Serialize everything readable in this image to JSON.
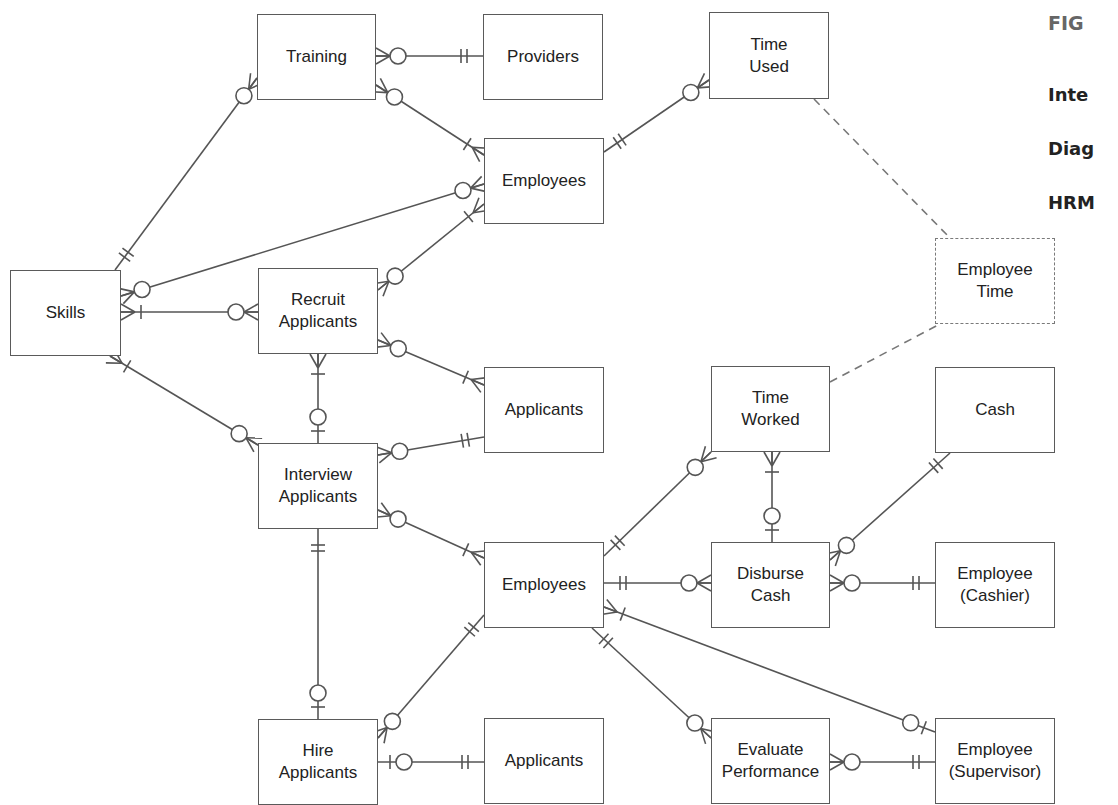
{
  "figure": {
    "label": "FIG",
    "caption_lines": [
      "Inte",
      "Diag",
      "HRM"
    ]
  },
  "style": {
    "line_color": "#555555",
    "border_color": "#5a5a5a",
    "caption_color": "#222222",
    "label_color": "#666666"
  },
  "entities": [
    {
      "id": "training",
      "label": "Training",
      "x": 257,
      "y": 14,
      "w": 119,
      "h": 86
    },
    {
      "id": "providers",
      "label": "Providers",
      "x": 483,
      "y": 14,
      "w": 120,
      "h": 86
    },
    {
      "id": "time_used",
      "label": "Time\nUsed",
      "x": 709,
      "y": 12,
      "w": 120,
      "h": 87
    },
    {
      "id": "employees_top",
      "label": "Employees",
      "x": 484,
      "y": 138,
      "w": 120,
      "h": 86
    },
    {
      "id": "skills",
      "label": "Skills",
      "x": 10,
      "y": 270,
      "w": 111,
      "h": 86
    },
    {
      "id": "recruit_applicants",
      "label": "Recruit\nApplicants",
      "x": 258,
      "y": 268,
      "w": 120,
      "h": 86
    },
    {
      "id": "employee_time",
      "label": "Employee\nTime",
      "x": 935,
      "y": 238,
      "w": 120,
      "h": 86,
      "dashed": true
    },
    {
      "id": "applicants_mid",
      "label": "Applicants",
      "x": 484,
      "y": 367,
      "w": 120,
      "h": 86
    },
    {
      "id": "time_worked",
      "label": "Time\nWorked",
      "x": 711,
      "y": 366,
      "w": 119,
      "h": 86
    },
    {
      "id": "cash",
      "label": "Cash",
      "x": 935,
      "y": 367,
      "w": 120,
      "h": 86
    },
    {
      "id": "interview_applicants",
      "label": "Interview\nApplicants",
      "x": 258,
      "y": 443,
      "w": 120,
      "h": 86
    },
    {
      "id": "employees_mid",
      "label": "Employees",
      "x": 484,
      "y": 542,
      "w": 120,
      "h": 86
    },
    {
      "id": "disburse_cash",
      "label": "Disburse\nCash",
      "x": 711,
      "y": 542,
      "w": 119,
      "h": 86
    },
    {
      "id": "employee_cashier",
      "label": "Employee\n(Cashier)",
      "x": 935,
      "y": 542,
      "w": 120,
      "h": 86
    },
    {
      "id": "hire_applicants",
      "label": "Hire\nApplicants",
      "x": 258,
      "y": 719,
      "w": 120,
      "h": 86
    },
    {
      "id": "applicants_bottom",
      "label": "Applicants",
      "x": 484,
      "y": 718,
      "w": 120,
      "h": 86
    },
    {
      "id": "evaluate_performance",
      "label": "Evaluate\nPerformance",
      "x": 711,
      "y": 718,
      "w": 119,
      "h": 86
    },
    {
      "id": "employee_supervisor",
      "label": "Employee\n(Supervisor)",
      "x": 935,
      "y": 718,
      "w": 120,
      "h": 86
    }
  ],
  "relationships": [
    {
      "from": "training",
      "to": "providers",
      "a": [
        376,
        56
      ],
      "b": [
        483,
        56
      ],
      "end_a": "zero-many",
      "end_b": "one-one"
    },
    {
      "from": "training",
      "to": "employees_top",
      "a": [
        376,
        85
      ],
      "b": [
        484,
        155
      ],
      "end_a": "zero-many",
      "end_b": "one-many"
    },
    {
      "from": "skills",
      "to": "training",
      "a": [
        115,
        270
      ],
      "b": [
        257,
        78
      ],
      "end_a": "one-one",
      "end_b": "zero-many"
    },
    {
      "from": "employees_top",
      "to": "time_used",
      "a": [
        604,
        152
      ],
      "b": [
        709,
        80
      ],
      "end_a": "one-one",
      "end_b": "zero-many"
    },
    {
      "from": "skills",
      "to": "employees_top",
      "a": [
        121,
        296
      ],
      "b": [
        484,
        184
      ],
      "end_a": "zero-many",
      "end_b": "zero-many"
    },
    {
      "from": "recruit_applicants",
      "to": "employees_top",
      "a": [
        378,
        290
      ],
      "b": [
        484,
        204
      ],
      "end_a": "zero-many",
      "end_b": "one-many"
    },
    {
      "from": "skills",
      "to": "recruit_applicants",
      "a": [
        121,
        312
      ],
      "b": [
        258,
        312
      ],
      "end_a": "one-many",
      "end_b": "zero-many"
    },
    {
      "from": "recruit_applicants",
      "to": "applicants_mid",
      "a": [
        378,
        340
      ],
      "b": [
        484,
        385
      ],
      "end_a": "zero-many",
      "end_b": "one-many"
    },
    {
      "from": "recruit_applicants",
      "to": "interview_applicants",
      "a": [
        318,
        354
      ],
      "b": [
        318,
        443
      ],
      "end_a": "one-many",
      "end_b": "zero-one"
    },
    {
      "from": "skills",
      "to": "interview_applicants",
      "a": [
        110,
        356
      ],
      "b": [
        258,
        445
      ],
      "end_a": "one-many",
      "end_b": "zero-many"
    },
    {
      "from": "interview_applicants",
      "to": "applicants_mid",
      "a": [
        378,
        455
      ],
      "b": [
        484,
        437
      ],
      "end_a": "zero-many",
      "end_b": "one-one"
    },
    {
      "from": "interview_applicants",
      "to": "employees_mid",
      "a": [
        378,
        510
      ],
      "b": [
        484,
        558
      ],
      "end_a": "zero-many",
      "end_b": "one-many"
    },
    {
      "from": "interview_applicants",
      "to": "hire_applicants",
      "a": [
        318,
        529
      ],
      "b": [
        318,
        719
      ],
      "end_a": "one-one",
      "end_b": "zero-one"
    },
    {
      "from": "employees_mid",
      "to": "time_worked",
      "a": [
        604,
        556
      ],
      "b": [
        711,
        452
      ],
      "end_a": "one-one",
      "end_b": "zero-many"
    },
    {
      "from": "time_worked",
      "to": "disburse_cash",
      "a": [
        772,
        452
      ],
      "b": [
        772,
        542
      ],
      "end_a": "one-many",
      "end_b": "zero-one"
    },
    {
      "from": "employees_mid",
      "to": "disburse_cash",
      "a": [
        604,
        583
      ],
      "b": [
        711,
        583
      ],
      "end_a": "one-one",
      "end_b": "zero-many"
    },
    {
      "from": "disburse_cash",
      "to": "cash",
      "a": [
        830,
        560
      ],
      "b": [
        950,
        453
      ],
      "end_a": "zero-many",
      "end_b": "one-one"
    },
    {
      "from": "disburse_cash",
      "to": "employee_cashier",
      "a": [
        830,
        583
      ],
      "b": [
        935,
        583
      ],
      "end_a": "zero-many",
      "end_b": "one-one"
    },
    {
      "from": "employees_mid",
      "to": "employee_supervisor",
      "a": [
        604,
        607
      ],
      "b": [
        935,
        732
      ],
      "end_a": "one-many",
      "end_b": "zero-one"
    },
    {
      "from": "employees_mid",
      "to": "evaluate_performance",
      "a": [
        592,
        628
      ],
      "b": [
        711,
        738
      ],
      "end_a": "one-one",
      "end_b": "zero-many"
    },
    {
      "from": "employees_mid",
      "to": "hire_applicants",
      "a": [
        484,
        615
      ],
      "b": [
        378,
        738
      ],
      "end_a": "one-one",
      "end_b": "zero-many"
    },
    {
      "from": "hire_applicants",
      "to": "applicants_bottom",
      "a": [
        378,
        762
      ],
      "b": [
        484,
        762
      ],
      "end_a": "zero-one",
      "end_b": "one-one"
    },
    {
      "from": "evaluate_performance",
      "to": "employee_supervisor",
      "a": [
        830,
        762
      ],
      "b": [
        935,
        762
      ],
      "end_a": "zero-many",
      "end_b": "one-one"
    }
  ],
  "dashed_links": [
    {
      "from": "time_used",
      "to": "employee_time",
      "a": [
        814,
        99
      ],
      "b": [
        950,
        238
      ]
    },
    {
      "from": "time_worked",
      "to": "employee_time",
      "a": [
        830,
        382
      ],
      "b": [
        940,
        324
      ]
    }
  ]
}
